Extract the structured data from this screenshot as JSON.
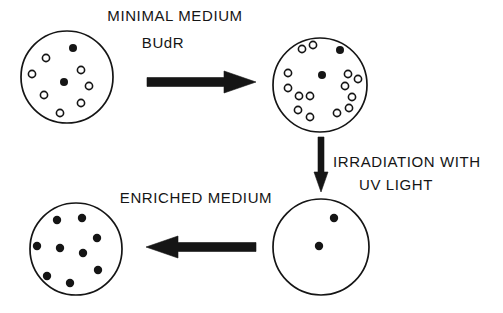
{
  "diagram": {
    "background_color": "#ffffff",
    "stroke_color": "#151515",
    "fill_color": "#151515",
    "open_cell_fill": "#ffffff",
    "width": 503,
    "height": 313,
    "labels": {
      "minimal_medium": "MINIMAL MEDIUM",
      "budr": "BUdR",
      "irradiation": "IRRADIATION WITH",
      "uv_light": "UV LIGHT",
      "enriched_medium": "ENRICHED MEDIUM"
    },
    "plates": [
      {
        "id": "plate-minimal-medium",
        "name": "top-left-plate",
        "cx": 67,
        "cy": 77,
        "r": 46,
        "filled_count": 2,
        "open_count": 7,
        "dot_r": 4.0,
        "open_r": 3.6,
        "filled_dots": [
          [
            73,
            48
          ],
          [
            64,
            82
          ]
        ],
        "open_dots": [
          [
            46,
            58
          ],
          [
            32,
            74
          ],
          [
            44,
            95
          ],
          [
            60,
            113
          ],
          [
            81,
            70
          ],
          [
            89,
            86
          ],
          [
            81,
            103
          ]
        ]
      },
      {
        "id": "plate-after-budr",
        "cx": 320,
        "cy": 85,
        "r": 47,
        "filled_count": 2,
        "open_count": 14,
        "dot_r": 4.0,
        "open_r": 3.6,
        "filled_dots": [
          [
            340,
            50
          ],
          [
            322,
            75
          ]
        ],
        "open_dots": [
          [
            302,
            49
          ],
          [
            313,
            45
          ],
          [
            288,
            73
          ],
          [
            288,
            88
          ],
          [
            299,
            96
          ],
          [
            310,
            96
          ],
          [
            348,
            74
          ],
          [
            358,
            79
          ],
          [
            345,
            86
          ],
          [
            352,
            97
          ],
          [
            298,
            110
          ],
          [
            310,
            117
          ],
          [
            337,
            113
          ],
          [
            349,
            108
          ]
        ]
      },
      {
        "id": "plate-after-uv",
        "cx": 321,
        "cy": 247,
        "r": 48,
        "filled_count": 2,
        "open_count": 0,
        "dot_r": 4.2,
        "open_r": 3.6,
        "filled_dots": [
          [
            334,
            218
          ],
          [
            319,
            246
          ]
        ],
        "open_dots": []
      },
      {
        "id": "plate-enriched",
        "cx": 76,
        "cy": 249,
        "r": 46,
        "filled_count": 9,
        "open_count": 0,
        "dot_r": 4.2,
        "open_r": 3.6,
        "filled_dots": [
          [
            57,
            220
          ],
          [
            82,
            218
          ],
          [
            97,
            238
          ],
          [
            37,
            246
          ],
          [
            60,
            248
          ],
          [
            83,
            253
          ],
          [
            98,
            270
          ],
          [
            47,
            276
          ],
          [
            70,
            283
          ]
        ],
        "open_dots": []
      }
    ],
    "arrows": [
      {
        "id": "arrow-budr",
        "name": "arrow-right-budr",
        "direction": "right",
        "x1": 147,
        "y1": 82,
        "x2": 256,
        "y2": 82,
        "shaft_thickness": 9,
        "head_length": 32,
        "head_width": 22
      },
      {
        "id": "arrow-uv",
        "name": "arrow-down-uv",
        "direction": "down",
        "x1": 321,
        "y1": 137,
        "x2": 321,
        "y2": 192,
        "shaft_thickness": 6,
        "head_length": 20,
        "head_width": 14
      },
      {
        "id": "arrow-enriched",
        "name": "arrow-left-enriched",
        "direction": "left",
        "x1": 256,
        "y1": 247,
        "x2": 146,
        "y2": 247,
        "shaft_thickness": 9,
        "head_length": 32,
        "head_width": 22
      }
    ],
    "text_positions": {
      "minimal_medium": {
        "x": 175,
        "y": 17,
        "anchor": "middle"
      },
      "budr": {
        "x": 163,
        "y": 44,
        "anchor": "middle"
      },
      "irradiation": {
        "x": 333,
        "y": 163,
        "anchor": "start"
      },
      "uv_light": {
        "x": 396,
        "y": 186,
        "anchor": "middle"
      },
      "enriched_medium": {
        "x": 196,
        "y": 199,
        "anchor": "middle"
      }
    }
  }
}
